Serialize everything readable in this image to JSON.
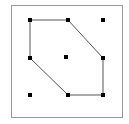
{
  "figure": {
    "title": "",
    "canvas": {
      "width": 129,
      "height": 124,
      "background": "#ffffff"
    },
    "frame": {
      "name": "plot-border",
      "x": 11,
      "y": 5,
      "width": 111,
      "height": 112,
      "stroke": "#999999",
      "stroke_width": 1,
      "fill": "#ffffff"
    },
    "hull": {
      "name": "convex-hull-polygon",
      "stroke": "#555555",
      "stroke_width": 1,
      "fill": "none",
      "vertex_count": 6,
      "points_attr": "30,20 68,20 103,58 103,95 68,95 30,58",
      "vertices": [
        {
          "label": "v1",
          "x": 30,
          "y": 20
        },
        {
          "label": "v2",
          "x": 68,
          "y": 20
        },
        {
          "label": "v3",
          "x": 103,
          "y": 58
        },
        {
          "label": "v4",
          "x": 103,
          "y": 95
        },
        {
          "label": "v5",
          "x": 68,
          "y": 95
        },
        {
          "label": "v6",
          "x": 30,
          "y": 58
        }
      ]
    },
    "points": {
      "name": "point-set",
      "color": "#000000",
      "size": 4,
      "items": [
        {
          "id": "p1",
          "x": 30,
          "y": 20,
          "role": "hull-vertex"
        },
        {
          "id": "p2",
          "x": 68,
          "y": 20,
          "role": "hull-vertex"
        },
        {
          "id": "p3",
          "x": 103,
          "y": 58,
          "role": "hull-vertex"
        },
        {
          "id": "p4",
          "x": 103,
          "y": 95,
          "role": "hull-vertex"
        },
        {
          "id": "p5",
          "x": 68,
          "y": 95,
          "role": "hull-vertex"
        },
        {
          "id": "p6",
          "x": 30,
          "y": 58,
          "role": "hull-vertex"
        },
        {
          "id": "p7",
          "x": 66,
          "y": 57,
          "role": "interior"
        },
        {
          "id": "p8",
          "x": 103,
          "y": 20,
          "role": "exterior"
        },
        {
          "id": "p9",
          "x": 30,
          "y": 95,
          "role": "exterior"
        }
      ]
    }
  },
  "chart_data": {
    "type": "scatter",
    "title": "",
    "xlabel": "",
    "ylabel": "",
    "grid": false,
    "legend": "none",
    "xlim": [
      11,
      122
    ],
    "ylim": [
      5,
      117
    ],
    "series": [
      {
        "name": "points",
        "marker": "square",
        "color": "#000000",
        "x": [
          30,
          68,
          103,
          103,
          68,
          30,
          66,
          103,
          30
        ],
        "y": [
          20,
          20,
          58,
          95,
          95,
          58,
          57,
          20,
          95
        ]
      }
    ],
    "annotations": [
      {
        "name": "convex-hull",
        "type": "polygon",
        "closed": true,
        "x": [
          30,
          68,
          103,
          103,
          68,
          30
        ],
        "y": [
          20,
          20,
          58,
          95,
          95,
          58
        ]
      }
    ]
  }
}
